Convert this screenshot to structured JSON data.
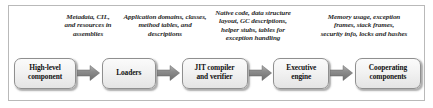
{
  "figure": {
    "border_color": "#b9b9b9",
    "background": "#ffffff",
    "node_fill": "#f2f2f2",
    "node_border": "#8f8f8f",
    "arrow_fill": "#8a8a8a",
    "text_color": "#121212"
  },
  "captions": [
    {
      "id": "caption-assemblies",
      "text": "Metadata, CIL,\nand resources in\nassemblies"
    },
    {
      "id": "caption-loaders-output",
      "text": "Application domains, classes,\nmethod tables, and\ndescriptions"
    },
    {
      "id": "caption-jit-output",
      "text": "Native code, data structure\nlayout, GC descriptions,\nhelper stubs, tables for\nexception handling"
    },
    {
      "id": "caption-engine-output",
      "text": "Memory usage, exception\nframes, stack frames,\nsecurity info, locks and hashes"
    }
  ],
  "nodes": [
    {
      "id": "node-high-level-component",
      "label": "High-level\ncomponent"
    },
    {
      "id": "node-loaders",
      "label": "Loaders"
    },
    {
      "id": "node-jit-compiler",
      "label": "JIT compiler\nand verifier"
    },
    {
      "id": "node-executive-engine",
      "label": "Executive\nengine"
    },
    {
      "id": "node-cooperating-components",
      "label": "Cooperating\ncomponents"
    }
  ],
  "arrows": [
    {
      "id": "arrow-1",
      "from": "High-level component",
      "to": "Loaders"
    },
    {
      "id": "arrow-2",
      "from": "Loaders",
      "to": "JIT compiler and verifier"
    },
    {
      "id": "arrow-3",
      "from": "JIT compiler and verifier",
      "to": "Executive engine"
    },
    {
      "id": "arrow-4",
      "from": "Executive engine",
      "to": "Cooperating components"
    }
  ]
}
